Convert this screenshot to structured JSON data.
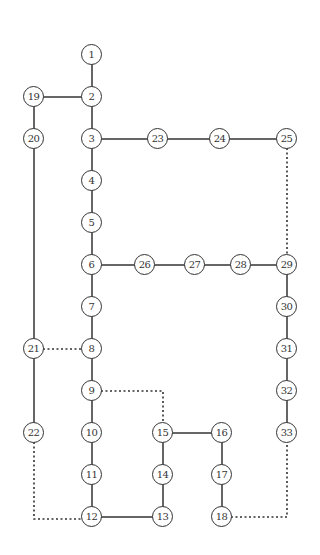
{
  "diagram": {
    "type": "network-graph",
    "colors": {
      "line": "#333333",
      "node_border": "#333333",
      "background": "#ffffff"
    },
    "nodes": [
      {
        "id": "1",
        "x": 92,
        "y": 55
      },
      {
        "id": "2",
        "x": 92,
        "y": 97
      },
      {
        "id": "3",
        "x": 92,
        "y": 139
      },
      {
        "id": "4",
        "x": 92,
        "y": 181
      },
      {
        "id": "5",
        "x": 92,
        "y": 223
      },
      {
        "id": "6",
        "x": 92,
        "y": 265
      },
      {
        "id": "7",
        "x": 92,
        "y": 307
      },
      {
        "id": "8",
        "x": 92,
        "y": 349
      },
      {
        "id": "9",
        "x": 92,
        "y": 391
      },
      {
        "id": "10",
        "x": 92,
        "y": 433
      },
      {
        "id": "11",
        "x": 92,
        "y": 475
      },
      {
        "id": "12",
        "x": 92,
        "y": 517
      },
      {
        "id": "13",
        "x": 163,
        "y": 517
      },
      {
        "id": "14",
        "x": 163,
        "y": 475
      },
      {
        "id": "15",
        "x": 163,
        "y": 433
      },
      {
        "id": "16",
        "x": 222,
        "y": 433
      },
      {
        "id": "17",
        "x": 222,
        "y": 475
      },
      {
        "id": "18",
        "x": 222,
        "y": 517
      },
      {
        "id": "19",
        "x": 34,
        "y": 97
      },
      {
        "id": "20",
        "x": 34,
        "y": 139
      },
      {
        "id": "21",
        "x": 34,
        "y": 349
      },
      {
        "id": "22",
        "x": 34,
        "y": 433
      },
      {
        "id": "23",
        "x": 158,
        "y": 139
      },
      {
        "id": "24",
        "x": 220,
        "y": 139
      },
      {
        "id": "25",
        "x": 287,
        "y": 139
      },
      {
        "id": "26",
        "x": 145,
        "y": 265
      },
      {
        "id": "27",
        "x": 195,
        "y": 265
      },
      {
        "id": "28",
        "x": 241,
        "y": 265
      },
      {
        "id": "29",
        "x": 287,
        "y": 265
      },
      {
        "id": "30",
        "x": 287,
        "y": 307
      },
      {
        "id": "31",
        "x": 287,
        "y": 349
      },
      {
        "id": "32",
        "x": 287,
        "y": 391
      },
      {
        "id": "33",
        "x": 287,
        "y": 433
      }
    ],
    "edges": [
      {
        "path": [
          [
            92,
            55
          ],
          [
            92,
            517
          ]
        ],
        "style": "solid"
      },
      {
        "path": [
          [
            34,
            97
          ],
          [
            92,
            97
          ]
        ],
        "style": "solid"
      },
      {
        "path": [
          [
            34,
            97
          ],
          [
            34,
            433
          ]
        ],
        "style": "solid"
      },
      {
        "path": [
          [
            92,
            139
          ],
          [
            287,
            139
          ]
        ],
        "style": "solid"
      },
      {
        "path": [
          [
            92,
            265
          ],
          [
            287,
            265
          ]
        ],
        "style": "solid"
      },
      {
        "path": [
          [
            287,
            265
          ],
          [
            287,
            433
          ]
        ],
        "style": "solid"
      },
      {
        "path": [
          [
            92,
            517
          ],
          [
            163,
            517
          ]
        ],
        "style": "solid"
      },
      {
        "path": [
          [
            163,
            517
          ],
          [
            163,
            433
          ]
        ],
        "style": "solid"
      },
      {
        "path": [
          [
            163,
            433
          ],
          [
            222,
            433
          ]
        ],
        "style": "solid"
      },
      {
        "path": [
          [
            222,
            433
          ],
          [
            222,
            517
          ]
        ],
        "style": "solid"
      },
      {
        "path": [
          [
            287,
            139
          ],
          [
            287,
            265
          ]
        ],
        "style": "dotted"
      },
      {
        "path": [
          [
            34,
            349
          ],
          [
            92,
            349
          ]
        ],
        "style": "dotted"
      },
      {
        "path": [
          [
            92,
            391
          ],
          [
            163,
            391
          ],
          [
            163,
            433
          ]
        ],
        "style": "dotted"
      },
      {
        "path": [
          [
            34,
            433
          ],
          [
            34,
            519
          ],
          [
            92,
            519
          ]
        ],
        "style": "dotted"
      },
      {
        "path": [
          [
            222,
            517
          ],
          [
            287,
            517
          ],
          [
            287,
            433
          ]
        ],
        "style": "dotted"
      }
    ]
  }
}
